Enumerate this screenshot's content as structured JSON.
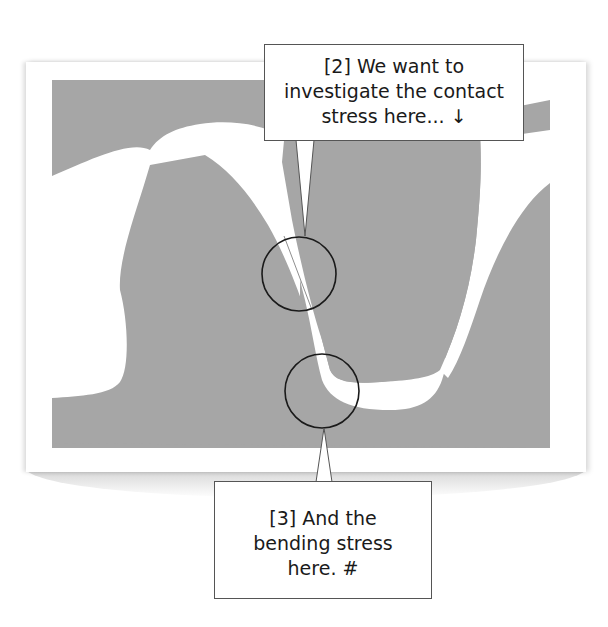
{
  "diagram": {
    "colors": {
      "gear_fill": "#a6a6a6",
      "gap_fill": "#ffffff",
      "circle_stroke": "#1a1a1a",
      "callout_border": "#555555"
    },
    "markers": [
      {
        "id": "contact-point",
        "cx": 299,
        "cy": 274,
        "r": 37
      },
      {
        "id": "root-fillet",
        "cx": 322,
        "cy": 391,
        "r": 37
      }
    ]
  },
  "callouts": {
    "top": {
      "lines": [
        "[2] We want to",
        "investigate the contact",
        "stress here... ↓"
      ]
    },
    "bottom": {
      "lines": [
        "[3] And the",
        "bending stress",
        "here.  #"
      ]
    }
  }
}
